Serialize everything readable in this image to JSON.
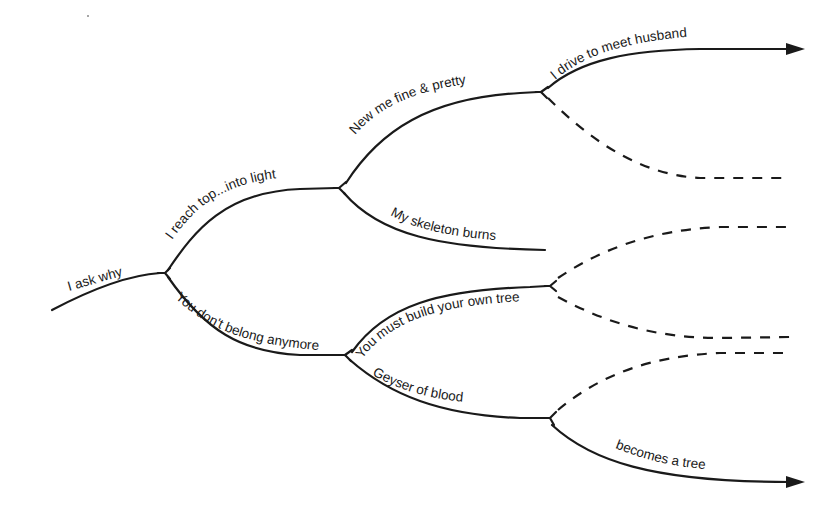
{
  "diagram": {
    "type": "branching-tree",
    "style": {
      "ink_color": "#1a1a1a",
      "background": "#ffffff"
    },
    "branches": [
      {
        "id": "root",
        "label": "I ask why",
        "line": "solid"
      },
      {
        "id": "up1",
        "label": "I reach top...into light",
        "line": "solid"
      },
      {
        "id": "up1-up",
        "label": "New me fine & pretty",
        "line": "solid"
      },
      {
        "id": "up1-up-up",
        "label": "I drive to meet husband",
        "line": "solid",
        "arrow": true
      },
      {
        "id": "up1-up-down",
        "label": "",
        "line": "dashed"
      },
      {
        "id": "up1-down",
        "label": "My skeleton burns",
        "line": "solid"
      },
      {
        "id": "down1",
        "label": "You don't belong anymore",
        "line": "solid"
      },
      {
        "id": "down1-up",
        "label": "You must build your own tree",
        "line": "solid"
      },
      {
        "id": "down1-up-up",
        "label": "",
        "line": "dashed"
      },
      {
        "id": "down1-up-down",
        "label": "",
        "line": "dashed"
      },
      {
        "id": "down1-down",
        "label": "Geyser of blood",
        "line": "solid"
      },
      {
        "id": "down1-down-up",
        "label": "",
        "line": "dashed"
      },
      {
        "id": "down1-down-down",
        "label": "becomes a tree",
        "line": "solid",
        "arrow": true
      }
    ]
  }
}
